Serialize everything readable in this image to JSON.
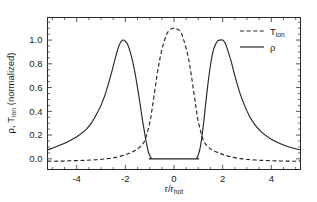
{
  "chart_data": {
    "type": "line",
    "title": "",
    "xlabel": "r/r_hot",
    "xlabel_main": "r/r",
    "xlabel_sub": "hot",
    "ylabel_main_rho": "ρ, T",
    "ylabel_sub": "ion",
    "ylabel_tail": " (normalized)",
    "ylabel": "ρ, T_ion (normalized)",
    "xlim": [
      -5.2,
      5.2
    ],
    "ylim": [
      -0.09,
      1.19
    ],
    "grid": false,
    "legend_position": "upper-right",
    "xticks": [
      -4,
      -2,
      0,
      2,
      4
    ],
    "xticklabels": [
      "-4",
      "-2",
      "0",
      "2",
      "4"
    ],
    "yticks": [
      0.0,
      0.2,
      0.4,
      0.6,
      0.8,
      1.0
    ],
    "yticklabels": [
      "0.0",
      "0.2",
      "0.4",
      "0.6",
      "0.8",
      "1.0"
    ],
    "series": [
      {
        "name": "T_ion",
        "label": "T",
        "label_sub": "ion",
        "style": "dashed",
        "color": "#262626",
        "peak_value": 1.1,
        "peak_x": 0.0,
        "baseline": -0.02,
        "x": [
          -5.2,
          -4.8,
          -4.4,
          -4.0,
          -3.6,
          -3.2,
          -2.8,
          -2.4,
          -2.0,
          -1.8,
          -1.6,
          -1.4,
          -1.2,
          -1.0,
          -0.9,
          -0.8,
          -0.7,
          -0.6,
          -0.5,
          -0.4,
          -0.3,
          -0.2,
          -0.1,
          0.0,
          0.1,
          0.2,
          0.3,
          0.4,
          0.5,
          0.6,
          0.7,
          0.8,
          0.9,
          1.0,
          1.2,
          1.4,
          1.6,
          1.8,
          2.0,
          2.4,
          2.8,
          3.2,
          3.6,
          4.0,
          4.4,
          4.8,
          5.2
        ],
        "y": [
          -0.02,
          -0.02,
          -0.018,
          -0.015,
          -0.012,
          -0.008,
          0.0,
          0.012,
          0.035,
          0.05,
          0.07,
          0.1,
          0.155,
          0.3,
          0.42,
          0.56,
          0.7,
          0.82,
          0.92,
          0.99,
          1.05,
          1.08,
          1.095,
          1.1,
          1.095,
          1.085,
          1.06,
          1.0,
          0.93,
          0.84,
          0.72,
          0.58,
          0.44,
          0.31,
          0.16,
          0.1,
          0.072,
          0.052,
          0.037,
          0.013,
          0.0,
          -0.008,
          -0.013,
          -0.016,
          -0.018,
          -0.02,
          -0.02
        ]
      },
      {
        "name": "rho",
        "label": "ρ",
        "style": "solid",
        "color": "#262626",
        "peak_value": 1.0,
        "peak_x_left": -2.1,
        "peak_x_right": 2.0,
        "flat_floor_range": [
          -0.88,
          0.88
        ],
        "flat_floor_value": 0.0,
        "x": [
          -5.2,
          -4.8,
          -4.4,
          -4.0,
          -3.6,
          -3.4,
          -3.2,
          -3.0,
          -2.8,
          -2.6,
          -2.45,
          -2.3,
          -2.2,
          -2.1,
          -2.0,
          -1.9,
          -1.8,
          -1.7,
          -1.6,
          -1.5,
          -1.4,
          -1.3,
          -1.25,
          -1.2,
          -1.15,
          -1.1,
          -1.05,
          -1.0,
          -0.95,
          -0.9,
          -0.88,
          0.88,
          0.9,
          0.95,
          1.0,
          1.05,
          1.1,
          1.15,
          1.2,
          1.25,
          1.3,
          1.4,
          1.5,
          1.6,
          1.7,
          1.8,
          1.9,
          2.0,
          2.1,
          2.2,
          2.35,
          2.5,
          2.7,
          2.9,
          3.1,
          3.3,
          3.6,
          4.0,
          4.4,
          4.8,
          5.2
        ],
        "y": [
          0.075,
          0.105,
          0.14,
          0.185,
          0.25,
          0.3,
          0.37,
          0.45,
          0.56,
          0.7,
          0.82,
          0.93,
          0.98,
          1.0,
          0.99,
          0.96,
          0.9,
          0.82,
          0.72,
          0.6,
          0.47,
          0.33,
          0.27,
          0.21,
          0.15,
          0.1,
          0.055,
          0.03,
          0.008,
          0.0,
          0.0,
          0.0,
          0.0,
          0.01,
          0.035,
          0.07,
          0.12,
          0.19,
          0.27,
          0.36,
          0.46,
          0.64,
          0.79,
          0.9,
          0.96,
          0.995,
          1.0,
          1.0,
          0.975,
          0.92,
          0.82,
          0.7,
          0.56,
          0.45,
          0.36,
          0.295,
          0.225,
          0.165,
          0.125,
          0.095,
          0.075
        ]
      }
    ]
  },
  "legend": {
    "entries": [
      {
        "label": "T",
        "sub": "ion",
        "style": "dashed"
      },
      {
        "label": "ρ",
        "sub": "",
        "style": "solid"
      }
    ]
  },
  "colors": {
    "axis": "#2b2b2b",
    "curve": "#262626",
    "background": "#ffffff"
  }
}
